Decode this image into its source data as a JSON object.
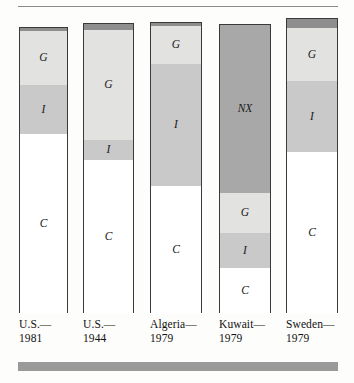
{
  "chart_data": {
    "type": "bar",
    "subtype": "stacked-bar",
    "title": "",
    "xlabel": "",
    "ylabel": "",
    "grid": false,
    "legend": false,
    "note": "Stacked composition-of-GDP bars. Segments from bottom to top: C (consumption), I (investment), G (government purchases), NX (net exports, top cap).",
    "categories": [
      "U.S.—1981",
      "U.S.—1944",
      "Algeria—1979",
      "Kuwait—1979",
      "Sweden—1979"
    ],
    "category_lines": [
      [
        "U.S.—",
        "1981"
      ],
      [
        "U.S.—",
        "1944"
      ],
      [
        "Algeria—",
        "1979"
      ],
      [
        "Kuwait—",
        "1979"
      ],
      [
        "Sweden—",
        "1979"
      ]
    ],
    "segment_order_bottom_to_top": [
      "C",
      "I",
      "G",
      "NX"
    ],
    "segment_labels": {
      "C": "C",
      "I": "I",
      "G": "G",
      "NX": "NX"
    },
    "series": [
      {
        "name": "C",
        "values": [
          63,
          53,
          44,
          16,
          55
        ]
      },
      {
        "name": "I",
        "values": [
          17,
          7,
          42,
          12,
          24
        ]
      },
      {
        "name": "G",
        "values": [
          19,
          38,
          13,
          14,
          18
        ]
      },
      {
        "name": "NX",
        "values": [
          1,
          2,
          1,
          58,
          3
        ]
      }
    ],
    "bars": [
      {
        "category": "U.S.—1981",
        "segments": [
          {
            "key": "NX",
            "label": "",
            "value": 1,
            "shown_label": false
          },
          {
            "key": "G",
            "label": "G",
            "value": 19,
            "shown_label": true
          },
          {
            "key": "I",
            "label": "I",
            "value": 17,
            "shown_label": true
          },
          {
            "key": "C",
            "label": "C",
            "value": 63,
            "shown_label": true
          }
        ]
      },
      {
        "category": "U.S.—1944",
        "segments": [
          {
            "key": "NX",
            "label": "",
            "value": 2,
            "shown_label": false
          },
          {
            "key": "G",
            "label": "G",
            "value": 38,
            "shown_label": true
          },
          {
            "key": "I",
            "label": "I",
            "value": 7,
            "shown_label": true
          },
          {
            "key": "C",
            "label": "C",
            "value": 53,
            "shown_label": true
          }
        ]
      },
      {
        "category": "Algeria—1979",
        "segments": [
          {
            "key": "NX",
            "label": "",
            "value": 1,
            "shown_label": false
          },
          {
            "key": "G",
            "label": "G",
            "value": 13,
            "shown_label": true
          },
          {
            "key": "I",
            "label": "I",
            "value": 42,
            "shown_label": true
          },
          {
            "key": "C",
            "label": "C",
            "value": 44,
            "shown_label": true
          }
        ]
      },
      {
        "category": "Kuwait—1979",
        "segments": [
          {
            "key": "NX",
            "label": "NX",
            "value": 58,
            "shown_label": true
          },
          {
            "key": "G",
            "label": "G",
            "value": 14,
            "shown_label": true
          },
          {
            "key": "I",
            "label": "I",
            "value": 12,
            "shown_label": true
          },
          {
            "key": "C",
            "label": "C",
            "value": 16,
            "shown_label": true
          }
        ]
      },
      {
        "category": "Sweden—1979",
        "segments": [
          {
            "key": "NX",
            "label": "",
            "value": 3,
            "shown_label": false
          },
          {
            "key": "G",
            "label": "G",
            "value": 18,
            "shown_label": true
          },
          {
            "key": "I",
            "label": "I",
            "value": 24,
            "shown_label": true
          },
          {
            "key": "C",
            "label": "C",
            "value": 55,
            "shown_label": true
          }
        ]
      }
    ],
    "colors": {
      "C": "#ffffff",
      "I": "#c9c9c9",
      "G": "#e2e2e0",
      "NX": "#a8a8a8",
      "cap": "#8e8e8e",
      "outline": "#3a3a3a",
      "rule": "#8a8a8a",
      "footer_bar": "#9a9a9a",
      "background": "#fdfdfb"
    }
  }
}
